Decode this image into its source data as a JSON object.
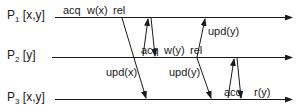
{
  "diagram": {
    "type": "space-time message diagram (lazy release consistency)",
    "processes": [
      {
        "id": "P1",
        "name": "P",
        "index": "1",
        "vars": "[x,y]",
        "line_y": 17
      },
      {
        "id": "P2",
        "name": "P",
        "index": "2",
        "vars": "[y]",
        "line_y": 57
      },
      {
        "id": "P3",
        "name": "P",
        "index": "3",
        "vars": "[x,y]",
        "line_y": 99
      }
    ],
    "events": {
      "p1": {
        "acq": "acq",
        "write": "w(x)",
        "rel": "rel"
      },
      "p2": {
        "acq": "acq",
        "write": "w(y)",
        "rel": "rel"
      },
      "p3": {
        "acq": "acq",
        "read": "r(y)"
      }
    },
    "messages": [
      {
        "from": "P1",
        "to": "P3",
        "label": "upd(x)"
      },
      {
        "from": "P2",
        "to": "P1",
        "label": ""
      },
      {
        "from": "P1",
        "to": "P2",
        "label": ""
      },
      {
        "from": "P2",
        "to": "P1",
        "label": "upd(y)"
      },
      {
        "from": "P2",
        "to": "P3",
        "label": "upd(y)"
      },
      {
        "from": "P3",
        "to": "P2",
        "label": ""
      },
      {
        "from": "P2",
        "to": "P3",
        "label": ""
      }
    ],
    "colors": {
      "line": "#1a1a1a",
      "background": "#ffffff"
    }
  }
}
